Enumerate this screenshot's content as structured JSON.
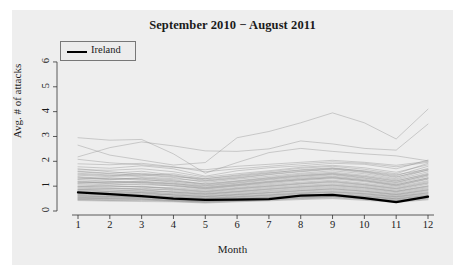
{
  "chart_data": {
    "type": "line",
    "title": "September 2010 − August 2011",
    "xlabel": "Month",
    "ylabel": "Avg. # of attacks",
    "xlim": [
      1,
      12
    ],
    "ylim": [
      0,
      6.4
    ],
    "grid": false,
    "legend": {
      "position": "top-left",
      "entries": [
        {
          "name": "Ireland",
          "color": "#000000",
          "width": 2.4
        }
      ]
    },
    "x": [
      1,
      2,
      3,
      4,
      5,
      6,
      7,
      8,
      9,
      10,
      11,
      12
    ],
    "xticks": [
      "1",
      "2",
      "3",
      "4",
      "5",
      "6",
      "7",
      "8",
      "9",
      "10",
      "11",
      "12"
    ],
    "yticks": [
      "0",
      "1",
      "2",
      "3",
      "4",
      "5",
      "6"
    ],
    "highlight_series": {
      "name": "Ireland",
      "color": "#000000",
      "values": [
        0.75,
        0.68,
        0.6,
        0.5,
        0.45,
        0.46,
        0.48,
        0.62,
        0.65,
        0.52,
        0.36,
        0.58
      ]
    },
    "background_series_color": "#8c8c8c",
    "background_series": [
      {
        "name": "bg-01",
        "values": [
          2.95,
          2.85,
          2.88,
          2.3,
          1.52,
          1.95,
          2.35,
          2.52,
          2.4,
          2.3,
          2.22,
          2.02
        ]
      },
      {
        "name": "bg-02",
        "values": [
          2.65,
          2.25,
          2.05,
          1.85,
          1.95,
          2.95,
          3.2,
          3.55,
          3.95,
          3.55,
          2.9,
          4.1
        ]
      },
      {
        "name": "bg-03",
        "values": [
          2.18,
          2.55,
          2.78,
          2.62,
          2.42,
          2.4,
          2.5,
          2.82,
          2.7,
          2.52,
          2.45,
          3.5
        ]
      },
      {
        "name": "bg-04",
        "values": [
          1.78,
          1.72,
          1.82,
          1.7,
          1.4,
          1.62,
          1.74,
          1.82,
          1.92,
          1.88,
          1.7,
          2.05
        ]
      },
      {
        "name": "bg-05",
        "values": [
          1.7,
          1.58,
          1.48,
          1.38,
          1.3,
          1.45,
          1.58,
          1.72,
          1.8,
          1.68,
          1.5,
          1.92
        ]
      },
      {
        "name": "bg-06",
        "values": [
          1.6,
          1.52,
          1.6,
          1.45,
          1.25,
          1.38,
          1.52,
          1.66,
          1.74,
          1.6,
          1.42,
          1.8
        ]
      },
      {
        "name": "bg-07",
        "values": [
          1.52,
          1.45,
          1.38,
          1.3,
          1.2,
          1.32,
          1.46,
          1.58,
          1.68,
          1.55,
          1.35,
          1.72
        ]
      },
      {
        "name": "bg-08",
        "values": [
          1.44,
          1.38,
          1.45,
          1.35,
          1.15,
          1.28,
          1.4,
          1.52,
          1.62,
          1.5,
          1.3,
          1.66
        ]
      },
      {
        "name": "bg-09",
        "values": [
          1.38,
          1.3,
          1.25,
          1.2,
          1.1,
          1.22,
          1.35,
          1.48,
          1.56,
          1.44,
          1.26,
          1.58
        ]
      },
      {
        "name": "bg-10",
        "values": [
          1.32,
          1.26,
          1.32,
          1.22,
          1.05,
          1.18,
          1.3,
          1.42,
          1.5,
          1.38,
          1.2,
          1.52
        ]
      },
      {
        "name": "bg-11",
        "values": [
          1.26,
          1.2,
          1.15,
          1.1,
          1.0,
          1.12,
          1.25,
          1.36,
          1.45,
          1.32,
          1.14,
          1.46
        ]
      },
      {
        "name": "bg-12",
        "values": [
          1.2,
          1.15,
          1.2,
          1.12,
          0.96,
          1.08,
          1.2,
          1.32,
          1.4,
          1.28,
          1.1,
          1.4
        ]
      },
      {
        "name": "bg-13",
        "values": [
          1.15,
          1.1,
          1.06,
          1.02,
          0.92,
          1.04,
          1.16,
          1.26,
          1.34,
          1.22,
          1.05,
          1.34
        ]
      },
      {
        "name": "bg-14",
        "values": [
          1.1,
          1.05,
          1.1,
          1.0,
          0.88,
          1.0,
          1.1,
          1.22,
          1.3,
          1.18,
          1.0,
          1.28
        ]
      },
      {
        "name": "bg-15",
        "values": [
          1.05,
          1.0,
          0.96,
          0.94,
          0.84,
          0.95,
          1.06,
          1.16,
          1.24,
          1.12,
          0.96,
          1.22
        ]
      },
      {
        "name": "bg-16",
        "values": [
          1.0,
          0.96,
          1.0,
          0.9,
          0.8,
          0.92,
          1.02,
          1.12,
          1.2,
          1.08,
          0.92,
          1.18
        ]
      },
      {
        "name": "bg-17",
        "values": [
          0.96,
          0.92,
          0.88,
          0.86,
          0.76,
          0.88,
          0.98,
          1.08,
          1.15,
          1.04,
          0.88,
          1.12
        ]
      },
      {
        "name": "bg-18",
        "values": [
          0.92,
          0.88,
          0.92,
          0.82,
          0.73,
          0.84,
          0.94,
          1.03,
          1.1,
          1.0,
          0.84,
          1.08
        ]
      },
      {
        "name": "bg-19",
        "values": [
          0.88,
          0.84,
          0.8,
          0.78,
          0.7,
          0.8,
          0.9,
          0.99,
          1.06,
          0.96,
          0.8,
          1.02
        ]
      },
      {
        "name": "bg-20",
        "values": [
          0.85,
          0.8,
          0.84,
          0.75,
          0.67,
          0.77,
          0.86,
          0.95,
          1.02,
          0.92,
          0.77,
          0.98
        ]
      },
      {
        "name": "bg-21",
        "values": [
          0.82,
          0.78,
          0.74,
          0.72,
          0.64,
          0.74,
          0.82,
          0.91,
          0.98,
          0.88,
          0.74,
          0.94
        ]
      },
      {
        "name": "bg-22",
        "values": [
          0.78,
          0.74,
          0.78,
          0.69,
          0.61,
          0.7,
          0.79,
          0.87,
          0.94,
          0.84,
          0.7,
          0.9
        ]
      },
      {
        "name": "bg-23",
        "values": [
          0.75,
          0.71,
          0.68,
          0.66,
          0.58,
          0.67,
          0.75,
          0.83,
          0.9,
          0.8,
          0.67,
          0.86
        ]
      },
      {
        "name": "bg-24",
        "values": [
          0.72,
          0.68,
          0.72,
          0.63,
          0.56,
          0.64,
          0.72,
          0.8,
          0.86,
          0.77,
          0.64,
          0.82
        ]
      },
      {
        "name": "bg-25",
        "values": [
          0.69,
          0.65,
          0.62,
          0.6,
          0.53,
          0.61,
          0.68,
          0.76,
          0.82,
          0.73,
          0.61,
          0.78
        ]
      },
      {
        "name": "bg-26",
        "values": [
          0.66,
          0.62,
          0.66,
          0.58,
          0.51,
          0.58,
          0.65,
          0.73,
          0.78,
          0.7,
          0.58,
          0.74
        ]
      },
      {
        "name": "bg-27",
        "values": [
          0.63,
          0.59,
          0.57,
          0.55,
          0.48,
          0.55,
          0.62,
          0.69,
          0.75,
          0.66,
          0.55,
          0.7
        ]
      },
      {
        "name": "bg-28",
        "values": [
          0.6,
          0.57,
          0.6,
          0.53,
          0.46,
          0.53,
          0.59,
          0.66,
          0.71,
          0.63,
          0.52,
          0.67
        ]
      },
      {
        "name": "bg-29",
        "values": [
          0.57,
          0.54,
          0.52,
          0.5,
          0.44,
          0.5,
          0.56,
          0.63,
          0.68,
          0.6,
          0.49,
          0.63
        ]
      },
      {
        "name": "bg-30",
        "values": [
          0.55,
          0.52,
          0.55,
          0.48,
          0.42,
          0.48,
          0.54,
          0.6,
          0.65,
          0.57,
          0.47,
          0.6
        ]
      },
      {
        "name": "bg-31",
        "values": [
          0.52,
          0.49,
          0.47,
          0.45,
          0.4,
          0.46,
          0.51,
          0.57,
          0.62,
          0.54,
          0.44,
          0.57
        ]
      },
      {
        "name": "bg-32",
        "values": [
          0.5,
          0.47,
          0.5,
          0.43,
          0.38,
          0.43,
          0.49,
          0.54,
          0.59,
          0.51,
          0.42,
          0.54
        ]
      },
      {
        "name": "bg-33",
        "values": [
          0.47,
          0.44,
          0.42,
          0.41,
          0.36,
          0.41,
          0.46,
          0.51,
          0.56,
          0.48,
          0.39,
          0.51
        ]
      },
      {
        "name": "bg-34",
        "values": [
          0.45,
          0.42,
          0.45,
          0.39,
          0.34,
          0.39,
          0.44,
          0.49,
          0.53,
          0.46,
          0.37,
          0.48
        ]
      },
      {
        "name": "bg-35",
        "values": [
          0.42,
          0.4,
          0.38,
          0.37,
          0.32,
          0.37,
          0.41,
          0.46,
          0.5,
          0.43,
          0.35,
          0.45
        ]
      },
      {
        "name": "bg-36",
        "values": [
          1.9,
          1.86,
          1.92,
          1.78,
          1.58,
          1.7,
          1.8,
          1.9,
          1.98,
          1.92,
          1.78,
          1.96
        ]
      },
      {
        "name": "bg-37",
        "values": [
          2.08,
          1.94,
          1.86,
          1.76,
          1.66,
          1.8,
          1.88,
          1.96,
          2.04,
          1.96,
          1.84,
          2.0
        ]
      },
      {
        "name": "bg-38",
        "values": [
          1.66,
          1.64,
          1.7,
          1.58,
          1.36,
          1.5,
          1.62,
          1.76,
          1.84,
          1.74,
          1.56,
          1.86
        ]
      },
      {
        "name": "bg-39",
        "values": [
          1.48,
          1.42,
          1.52,
          1.42,
          1.22,
          1.34,
          1.48,
          1.6,
          1.7,
          1.58,
          1.38,
          1.64
        ]
      },
      {
        "name": "bg-40",
        "values": [
          1.28,
          1.34,
          1.28,
          1.16,
          1.02,
          1.14,
          1.28,
          1.4,
          1.48,
          1.34,
          1.16,
          1.44
        ]
      },
      {
        "name": "bg-41",
        "values": [
          1.12,
          1.18,
          1.14,
          1.04,
          0.9,
          1.02,
          1.14,
          1.26,
          1.34,
          1.22,
          1.02,
          1.3
        ]
      },
      {
        "name": "bg-42",
        "values": [
          0.98,
          1.02,
          0.98,
          0.88,
          0.78,
          0.9,
          1.0,
          1.1,
          1.18,
          1.06,
          0.9,
          1.14
        ]
      },
      {
        "name": "bg-43",
        "values": [
          0.86,
          0.9,
          0.86,
          0.76,
          0.68,
          0.78,
          0.88,
          0.97,
          1.04,
          0.94,
          0.79,
          1.0
        ]
      },
      {
        "name": "bg-44",
        "values": [
          0.74,
          0.78,
          0.74,
          0.65,
          0.58,
          0.66,
          0.74,
          0.82,
          0.89,
          0.8,
          0.66,
          0.85
        ]
      },
      {
        "name": "bg-45",
        "values": [
          0.64,
          0.67,
          0.64,
          0.56,
          0.5,
          0.57,
          0.64,
          0.71,
          0.77,
          0.69,
          0.57,
          0.73
        ]
      },
      {
        "name": "bg-46",
        "values": [
          0.56,
          0.58,
          0.55,
          0.48,
          0.43,
          0.49,
          0.55,
          0.61,
          0.66,
          0.59,
          0.49,
          0.63
        ]
      },
      {
        "name": "bg-47",
        "values": [
          0.48,
          0.5,
          0.48,
          0.42,
          0.37,
          0.42,
          0.48,
          0.53,
          0.58,
          0.51,
          0.42,
          0.55
        ]
      },
      {
        "name": "bg-48",
        "values": [
          1.58,
          1.5,
          1.44,
          1.5,
          1.3,
          1.42,
          1.54,
          1.64,
          1.72,
          1.62,
          1.46,
          1.68
        ]
      },
      {
        "name": "bg-49",
        "values": [
          1.36,
          1.28,
          1.34,
          1.26,
          1.08,
          1.2,
          1.33,
          1.44,
          1.52,
          1.4,
          1.22,
          1.48
        ]
      },
      {
        "name": "bg-50",
        "values": [
          1.18,
          1.12,
          1.18,
          1.08,
          0.94,
          1.06,
          1.18,
          1.29,
          1.37,
          1.25,
          1.06,
          1.33
        ]
      }
    ]
  }
}
